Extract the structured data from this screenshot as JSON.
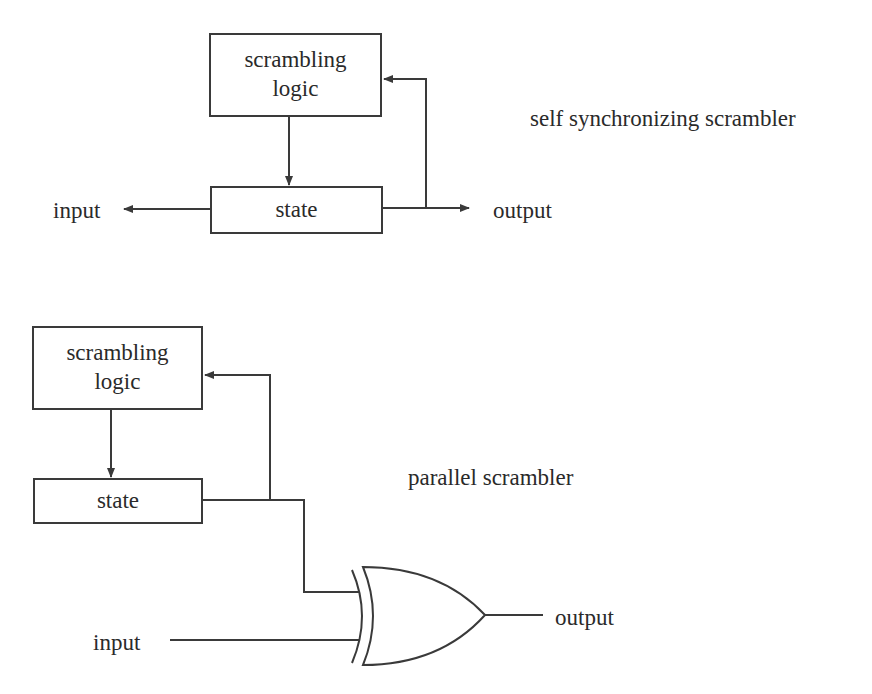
{
  "top_diagram": {
    "title": "self synchronizing scrambler",
    "logic_box": {
      "line1": "scrambling",
      "line2": "logic"
    },
    "state_box": "state",
    "input_label": "input",
    "output_label": "output"
  },
  "bottom_diagram": {
    "title": "parallel scrambler",
    "logic_box": {
      "line1": "scrambling",
      "line2": "logic"
    },
    "state_box": "state",
    "gate": "XOR",
    "input_label": "input",
    "output_label": "output"
  },
  "colors": {
    "line": "#3a3a3a",
    "background": "#ffffff"
  }
}
